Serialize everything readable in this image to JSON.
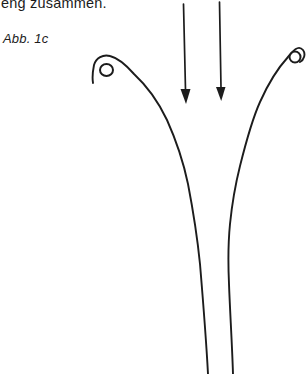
{
  "page": {
    "background": "#ffffff",
    "ink_color": "#1c1c1c"
  },
  "texts": {
    "top_caption": "eng zusammen.",
    "figure_label": "Abb. 1c"
  },
  "figure": {
    "type": "line-drawing",
    "arrow_count": 2,
    "arrow_direction": "down"
  }
}
